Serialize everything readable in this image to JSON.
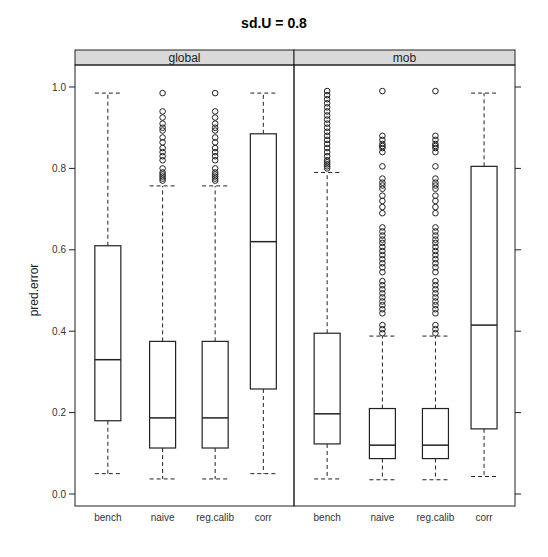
{
  "chart_data": {
    "type": "box",
    "title": "sd.U =  0.8",
    "ylabel": "pred.error",
    "xlabel": "",
    "ylim": [
      0.0,
      1.0
    ],
    "yticks": [
      "0.0",
      "0.2",
      "0.4",
      "0.6",
      "0.8",
      "1.0"
    ],
    "ytick_values": [
      0.0,
      0.2,
      0.4,
      0.6,
      0.8,
      1.0
    ],
    "categories": [
      "bench",
      "naive",
      "reg.calib",
      "corr"
    ],
    "grid": false,
    "colors": {
      "strip": "#d9d9d9",
      "line": "#222222",
      "background": "#ffffff"
    },
    "panels": [
      {
        "name": "global",
        "boxes": [
          {
            "category": "bench",
            "whisker_low": 0.05,
            "q1": 0.18,
            "median": 0.33,
            "q3": 0.61,
            "whisker_high": 0.985,
            "outliers": []
          },
          {
            "category": "naive",
            "whisker_low": 0.037,
            "q1": 0.113,
            "median": 0.187,
            "q3": 0.375,
            "whisker_high": 0.757,
            "outliers": [
              0.985,
              0.94,
              0.925,
              0.91,
              0.9,
              0.893,
              0.876,
              0.864,
              0.85,
              0.84,
              0.83,
              0.82,
              0.8,
              0.79,
              0.785,
              0.78,
              0.775,
              0.77
            ]
          },
          {
            "category": "reg.calib",
            "whisker_low": 0.037,
            "q1": 0.113,
            "median": 0.187,
            "q3": 0.375,
            "whisker_high": 0.757,
            "outliers": [
              0.985,
              0.94,
              0.925,
              0.91,
              0.9,
              0.893,
              0.876,
              0.864,
              0.85,
              0.84,
              0.83,
              0.82,
              0.8,
              0.79,
              0.785,
              0.78,
              0.775,
              0.77
            ]
          },
          {
            "category": "corr",
            "whisker_low": 0.05,
            "q1": 0.258,
            "median": 0.62,
            "q3": 0.885,
            "whisker_high": 0.985,
            "outliers": []
          }
        ]
      },
      {
        "name": "mob",
        "boxes": [
          {
            "category": "bench",
            "whisker_low": 0.037,
            "q1": 0.123,
            "median": 0.197,
            "q3": 0.395,
            "whisker_high": 0.79,
            "outliers": [
              0.99,
              0.98,
              0.97,
              0.96,
              0.95,
              0.94,
              0.93,
              0.92,
              0.91,
              0.9,
              0.89,
              0.88,
              0.87,
              0.86,
              0.85,
              0.84,
              0.83,
              0.82,
              0.815,
              0.81,
              0.805,
              0.8
            ]
          },
          {
            "category": "naive",
            "whisker_low": 0.035,
            "q1": 0.087,
            "median": 0.12,
            "q3": 0.21,
            "whisker_high": 0.388,
            "outliers": [
              0.99,
              0.88,
              0.87,
              0.86,
              0.855,
              0.85,
              0.84,
              0.805,
              0.775,
              0.765,
              0.758,
              0.75,
              0.733,
              0.72,
              0.705,
              0.69,
              0.655,
              0.645,
              0.635,
              0.625,
              0.617,
              0.607,
              0.597,
              0.587,
              0.577,
              0.567,
              0.557,
              0.545,
              0.523,
              0.513,
              0.503,
              0.493,
              0.483,
              0.473,
              0.464,
              0.454,
              0.444,
              0.415,
              0.405,
              0.395
            ]
          },
          {
            "category": "reg.calib",
            "whisker_low": 0.035,
            "q1": 0.087,
            "median": 0.12,
            "q3": 0.21,
            "whisker_high": 0.388,
            "outliers": [
              0.99,
              0.88,
              0.87,
              0.86,
              0.855,
              0.85,
              0.84,
              0.805,
              0.775,
              0.765,
              0.758,
              0.75,
              0.733,
              0.72,
              0.705,
              0.69,
              0.655,
              0.645,
              0.635,
              0.625,
              0.617,
              0.607,
              0.597,
              0.587,
              0.577,
              0.567,
              0.557,
              0.545,
              0.523,
              0.513,
              0.503,
              0.493,
              0.483,
              0.473,
              0.464,
              0.454,
              0.444,
              0.415,
              0.405,
              0.395
            ]
          },
          {
            "category": "corr",
            "whisker_low": 0.043,
            "q1": 0.16,
            "median": 0.415,
            "q3": 0.805,
            "whisker_high": 0.985,
            "outliers": []
          }
        ]
      }
    ]
  }
}
